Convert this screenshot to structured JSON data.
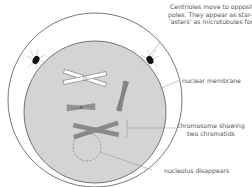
{
  "diagram": {
    "labels": {
      "centrioles_line1": "Centrioles move to opposite",
      "centrioles_line2": "poles. They appear as star-like",
      "centrioles_line3": "'asters' as microtubules form.",
      "nuclear_membrane": "nuclear membrane",
      "chromosome_line1": "chromosome showing",
      "chromosome_line2": "two chromatids",
      "nucleolus": "nucleolus disappears"
    },
    "colors": {
      "cell_outline": "#555555",
      "nucleus_fill": "#d4d4d4",
      "chromosome_dark": "#7a7a7a",
      "chromosome_light": "#ffffff",
      "centriole": "#111111",
      "leader_line": "#999999",
      "text": "#555555"
    }
  }
}
